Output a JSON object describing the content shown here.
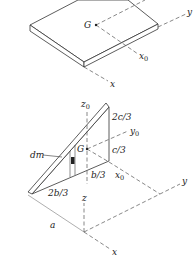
{
  "figure": {
    "colors": {
      "line": "#333333",
      "dash": "#555555",
      "plate_fill": "#ffffff",
      "element_fill": "#222222"
    },
    "top_plate": {
      "labels": {
        "G": "G",
        "y": "y",
        "x0_main": "x",
        "x0_sub": "0",
        "x": "x"
      }
    },
    "triangle_plate": {
      "labels": {
        "z0_main": "z",
        "z0_sub": "0",
        "two_c_third": "2c/3",
        "y0_main": "y",
        "y0_sub": "0",
        "c_third": "c/3",
        "G": "G",
        "dm": "dm",
        "b_third": "b/3",
        "x0_main": "x",
        "x0_sub": "0",
        "two_b_third": "2b/3",
        "z": "z",
        "y": "y",
        "a": "a",
        "x": "x"
      }
    }
  }
}
